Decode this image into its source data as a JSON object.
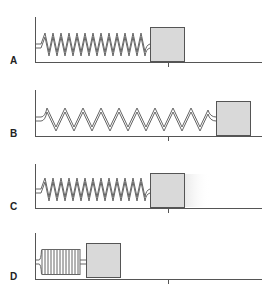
{
  "panels": [
    {
      "label": "A",
      "state": "equilibrium",
      "block_x": 150
    },
    {
      "label": "B",
      "state": "stretched",
      "block_x": 216
    },
    {
      "label": "C",
      "state": "equilibrium-moving",
      "block_x": 150
    },
    {
      "label": "D",
      "state": "compressed",
      "block_x": 86
    }
  ],
  "colors": {
    "block_fill": "#d9d9d9",
    "line": "#555555",
    "spring": "#666666"
  }
}
